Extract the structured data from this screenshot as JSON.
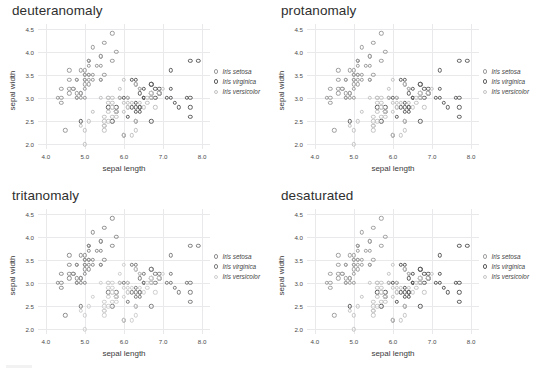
{
  "figure": {
    "background": "#ffffff",
    "panel_order": [
      "deuteranomaly",
      "protanomaly",
      "tritanomaly",
      "desaturated"
    ]
  },
  "axis": {
    "xlabel": "sepal length",
    "ylabel": "sepal width",
    "xticks": [
      "4.0",
      "5.0",
      "6.0",
      "7.0",
      "8.0"
    ],
    "yticks": [
      "2.0",
      "2.5",
      "3.0",
      "3.5",
      "4.0",
      "4.5"
    ],
    "xlim": [
      3.8,
      8.2
    ],
    "ylim": [
      1.9,
      4.6
    ],
    "grid": true
  },
  "legend": {
    "position": "right",
    "entries": [
      {
        "label": "Iris setosa",
        "color": "#9a9a9a"
      },
      {
        "label": "Iris virginica",
        "color": "#5e5e5e"
      },
      {
        "label": "Iris versicolor",
        "color": "#c2c2c2"
      }
    ]
  },
  "chart_data": [
    {
      "type": "scatter",
      "title": "deuteranomaly",
      "xlabel": "sepal length",
      "ylabel": "sepal width",
      "xlim": [
        3.8,
        8.2
      ],
      "ylim": [
        1.9,
        4.6
      ],
      "grid": true,
      "legend": [
        "Iris setosa",
        "Iris virginica",
        "Iris versicolor"
      ],
      "series": [
        {
          "name": "Iris setosa",
          "color": "#9a9a9a",
          "x": [
            5.1,
            4.9,
            4.7,
            4.6,
            5.0,
            5.4,
            4.6,
            5.0,
            4.4,
            4.9,
            5.4,
            4.8,
            4.8,
            4.3,
            5.8,
            5.7,
            5.4,
            5.1,
            5.7,
            5.1,
            5.4,
            5.1,
            4.6,
            5.1,
            4.8,
            5.0,
            5.0,
            5.2,
            5.2,
            4.7,
            4.8,
            5.4,
            5.2,
            5.5,
            4.9,
            5.0,
            5.5,
            4.9,
            4.4,
            5.1,
            5.0,
            4.5,
            4.4,
            5.0,
            5.1,
            4.8,
            5.1,
            4.6,
            5.3,
            5.0
          ],
          "y": [
            3.5,
            3.0,
            3.2,
            3.1,
            3.6,
            3.9,
            3.4,
            3.4,
            2.9,
            3.1,
            3.7,
            3.4,
            3.0,
            3.0,
            4.0,
            4.4,
            3.9,
            3.5,
            3.8,
            3.8,
            3.4,
            3.7,
            3.6,
            3.3,
            3.4,
            3.0,
            3.4,
            3.5,
            3.4,
            3.2,
            3.1,
            3.4,
            4.1,
            4.2,
            3.1,
            3.2,
            3.5,
            3.6,
            3.0,
            3.4,
            3.5,
            2.3,
            3.2,
            3.5,
            3.8,
            3.0,
            3.8,
            3.2,
            3.7,
            3.3
          ]
        },
        {
          "name": "Iris virginica",
          "color": "#5e5e5e",
          "x": [
            6.3,
            5.8,
            7.1,
            6.3,
            6.5,
            7.6,
            4.9,
            7.3,
            6.7,
            7.2,
            6.5,
            6.4,
            6.8,
            5.7,
            5.8,
            6.4,
            6.5,
            7.7,
            7.7,
            6.0,
            6.9,
            5.6,
            7.7,
            6.3,
            6.7,
            7.2,
            6.2,
            6.1,
            6.4,
            7.2,
            7.4,
            7.9,
            6.4,
            6.3,
            6.1,
            7.7,
            6.3,
            6.4,
            6.0,
            6.9,
            6.7,
            6.9,
            5.8,
            6.8,
            6.7,
            6.7,
            6.3,
            6.5,
            6.2,
            5.9
          ],
          "y": [
            3.3,
            2.7,
            3.0,
            2.9,
            3.0,
            3.0,
            2.5,
            2.9,
            2.5,
            3.6,
            3.2,
            2.7,
            3.0,
            2.5,
            2.8,
            3.2,
            3.0,
            3.8,
            2.6,
            2.2,
            3.2,
            2.8,
            2.8,
            2.7,
            3.3,
            3.2,
            2.8,
            3.0,
            2.8,
            3.0,
            2.8,
            3.8,
            2.8,
            2.8,
            2.6,
            3.0,
            3.4,
            3.1,
            3.0,
            3.1,
            3.1,
            3.1,
            2.7,
            3.2,
            3.3,
            3.0,
            2.5,
            3.0,
            3.4,
            3.0
          ]
        },
        {
          "name": "Iris versicolor",
          "color": "#c2c2c2",
          "x": [
            7.0,
            6.4,
            6.9,
            5.5,
            6.5,
            5.7,
            6.3,
            4.9,
            6.6,
            5.2,
            5.0,
            5.9,
            6.0,
            6.1,
            5.6,
            6.7,
            5.6,
            5.8,
            6.2,
            5.6,
            5.9,
            6.1,
            6.3,
            6.1,
            6.4,
            6.6,
            6.8,
            6.7,
            6.0,
            5.7,
            5.5,
            5.5,
            5.8,
            6.0,
            5.4,
            6.0,
            6.7,
            6.3,
            5.6,
            5.5,
            5.5,
            6.1,
            5.8,
            5.0,
            5.6,
            5.7,
            5.7,
            6.2,
            5.1,
            5.7
          ],
          "y": [
            3.2,
            3.2,
            3.1,
            2.3,
            2.8,
            2.8,
            3.3,
            2.4,
            2.9,
            2.7,
            2.0,
            3.0,
            2.2,
            2.9,
            2.9,
            3.1,
            3.0,
            2.7,
            2.2,
            2.5,
            3.2,
            2.8,
            2.5,
            2.8,
            2.9,
            3.0,
            2.8,
            3.0,
            2.9,
            2.6,
            2.4,
            2.4,
            2.7,
            2.7,
            3.0,
            3.4,
            3.1,
            2.3,
            3.0,
            2.5,
            2.6,
            3.0,
            2.6,
            2.3,
            2.7,
            3.0,
            2.9,
            2.9,
            2.5,
            2.8
          ]
        }
      ]
    },
    {
      "type": "scatter",
      "title": "protanomaly",
      "xlabel": "sepal length",
      "ylabel": "sepal width",
      "xlim": [
        3.8,
        8.2
      ],
      "ylim": [
        1.9,
        4.6
      ],
      "grid": true,
      "legend": [
        "Iris setosa",
        "Iris virginica",
        "Iris versicolor"
      ],
      "series": [
        {
          "name": "Iris setosa",
          "color": "#9d9d9d"
        },
        {
          "name": "Iris virginica",
          "color": "#626262"
        },
        {
          "name": "Iris versicolor",
          "color": "#c4c4c4"
        }
      ]
    },
    {
      "type": "scatter",
      "title": "tritanomaly",
      "xlabel": "sepal length",
      "ylabel": "sepal width",
      "xlim": [
        3.8,
        8.2
      ],
      "ylim": [
        1.9,
        4.6
      ],
      "grid": true,
      "legend": [
        "Iris setosa",
        "Iris virginica",
        "Iris versicolor"
      ],
      "series": [
        {
          "name": "Iris setosa",
          "color": "#8f8f8f"
        },
        {
          "name": "Iris virginica",
          "color": "#7e7e7e"
        },
        {
          "name": "Iris versicolor",
          "color": "#cfcfcf"
        }
      ]
    },
    {
      "type": "scatter",
      "title": "desaturated",
      "xlabel": "sepal length",
      "ylabel": "sepal width",
      "xlim": [
        3.8,
        8.2
      ],
      "ylim": [
        1.9,
        4.6
      ],
      "grid": true,
      "legend": [
        "Iris setosa",
        "Iris virginica",
        "Iris versicolor"
      ],
      "series": [
        {
          "name": "Iris setosa",
          "color": "#a0a0a0"
        },
        {
          "name": "Iris virginica",
          "color": "#5a5a5a"
        },
        {
          "name": "Iris versicolor",
          "color": "#c6c6c6"
        }
      ]
    }
  ]
}
